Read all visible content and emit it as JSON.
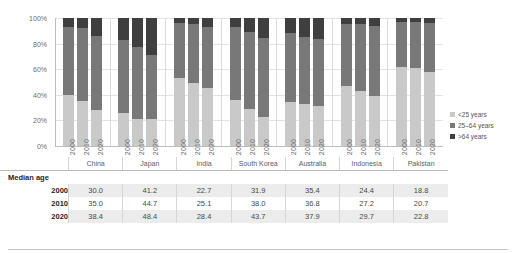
{
  "chart_data": {
    "type": "bar",
    "subtype": "stacked-percent",
    "title": "",
    "xlabel": "",
    "ylabel": "",
    "ylim": [
      0,
      100
    ],
    "ytick_labels": [
      "0%",
      "20%",
      "40%",
      "60%",
      "80%",
      "100%"
    ],
    "ytick_values": [
      0,
      20,
      40,
      60,
      80,
      100
    ],
    "grid": true,
    "legend_position": "right",
    "categories": [
      "China",
      "Japan",
      "India",
      "South Korea",
      "Australia",
      "Indonesia",
      "Pakistan"
    ],
    "years": [
      "2000",
      "2010",
      "2020"
    ],
    "series": [
      {
        "name": "<25 years",
        "color": "#c9c9c9",
        "values": {
          "China": [
            40.0,
            35.0,
            28.0
          ],
          "Japan": [
            26.0,
            21.0,
            21.0
          ],
          "India": [
            53.0,
            49.0,
            45.0
          ],
          "South Korea": [
            36.0,
            29.0,
            23.0
          ],
          "Australia": [
            34.0,
            33.0,
            31.0
          ],
          "Indonesia": [
            47.0,
            43.0,
            39.0
          ],
          "Pakistan": [
            62.0,
            61.0,
            58.0
          ]
        }
      },
      {
        "name": "25–64 years",
        "color": "#787878",
        "values": {
          "China": [
            53.0,
            57.0,
            58.0
          ],
          "Japan": [
            57.0,
            56.0,
            50.0
          ],
          "India": [
            43.0,
            46.0,
            48.0
          ],
          "South Korea": [
            57.0,
            60.0,
            61.0
          ],
          "Australia": [
            54.0,
            52.0,
            53.0
          ],
          "Indonesia": [
            48.0,
            52.0,
            55.0
          ],
          "Pakistan": [
            35.0,
            36.0,
            38.0
          ]
        }
      },
      {
        "name": ">64 years",
        "color": "#3f3f3f",
        "values": {
          "China": [
            7.0,
            8.0,
            14.0
          ],
          "Japan": [
            17.0,
            23.0,
            29.0
          ],
          "India": [
            4.0,
            5.0,
            7.0
          ],
          "South Korea": [
            7.0,
            11.0,
            16.0
          ],
          "Australia": [
            12.0,
            15.0,
            16.0
          ],
          "Indonesia": [
            5.0,
            5.0,
            6.0
          ],
          "Pakistan": [
            3.0,
            3.0,
            4.0
          ]
        }
      }
    ]
  },
  "legend": {
    "items": [
      {
        "label": "<25 years",
        "color": "#c9c9c9"
      },
      {
        "label": "25–64 years",
        "color": "#787878"
      },
      {
        "label": ">64 years",
        "color": "#3f3f3f"
      }
    ]
  },
  "table": {
    "title": "Median age",
    "columns": [
      "China",
      "Japan",
      "India",
      "South Korea",
      "Australia",
      "Indonesia",
      "Pakistan"
    ],
    "rows": [
      {
        "label": "2000",
        "values": [
          "30.0",
          "41.2",
          "22.7",
          "31.9",
          "35.4",
          "24.4",
          "18.8"
        ]
      },
      {
        "label": "2010",
        "values": [
          "35.0",
          "44.7",
          "25.1",
          "38.0",
          "36.8",
          "27.2",
          "20.7"
        ]
      },
      {
        "label": "2020",
        "values": [
          "38.4",
          "48.4",
          "28.4",
          "43.7",
          "37.9",
          "29.7",
          "22.8"
        ]
      }
    ]
  }
}
